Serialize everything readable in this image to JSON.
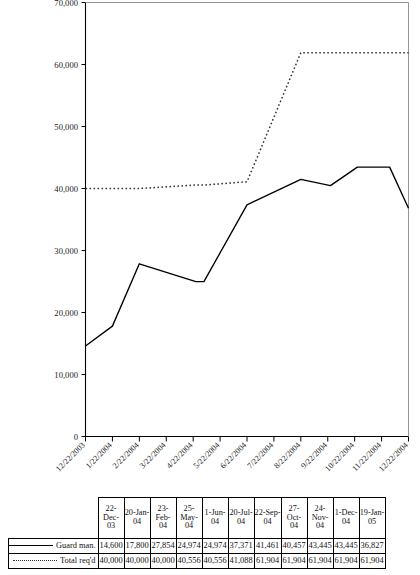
{
  "chart_data": {
    "type": "line",
    "title": "",
    "xlabel": "",
    "ylabel": "",
    "ylim": [
      0,
      70000
    ],
    "ytick_values": [
      0,
      10000,
      20000,
      30000,
      40000,
      50000,
      60000,
      70000
    ],
    "ytick_labels": [
      "0",
      "10,000",
      "20,000",
      "30,000",
      "40,000",
      "50,000",
      "60,000",
      "70,000"
    ],
    "grid": false,
    "legend_position": "table-below",
    "x": [
      "12/22/2003",
      "1/22/2004",
      "2/22/2004",
      "3/22/2004",
      "4/22/2004",
      "5/22/2004",
      "6/22/2004",
      "7/22/2004",
      "8/22/2004",
      "9/22/2004",
      "10/22/2004",
      "11/22/2004",
      "12/22/2004"
    ],
    "categories": [
      "22-Dec-03",
      "20-Jan-04",
      "23-Feb-04",
      "25-May-04",
      "1-Jun-04",
      "20-Jul-04",
      "22-Sep-04",
      "27-Oct-04",
      "24-Nov-04",
      "1-Dec-04",
      "19-Jan-05"
    ],
    "series": [
      {
        "name": "Guard man.",
        "style": "solid",
        "color": "#000000",
        "values": [
          14600,
          17800,
          27854,
          24974,
          24974,
          37371,
          41461,
          40457,
          43445,
          43445,
          36827
        ]
      },
      {
        "name": "Total req'd",
        "style": "dotted",
        "color": "#333333",
        "values": [
          40000,
          40000,
          40000,
          40556,
          40556,
          41088,
          61904,
          61904,
          61904,
          61904,
          61904
        ]
      }
    ]
  },
  "table": {
    "header_dates": [
      "22-Dec-\n03",
      "20-Jan-\n04",
      "23-Feb-\n04",
      "25-\nMay-\n04",
      "1-Jun-\n04",
      "20-Jul-\n04",
      "22-Sep-\n04",
      "27-Oct-\n04",
      "24-\nNov-\n04",
      "1-Dec-\n04",
      "19-Jan-\n05"
    ],
    "rows": [
      {
        "label": "Guard man.",
        "swatch": "solid",
        "values": [
          "14,600",
          "17,800",
          "27,854",
          "24,974",
          "24,974",
          "37,371",
          "41,461",
          "40,457",
          "43,445",
          "43,445",
          "36,827"
        ]
      },
      {
        "label": "Total req'd",
        "swatch": "dotted",
        "values": [
          "40,000",
          "40,000",
          "40,000",
          "40,556",
          "40,556",
          "41,088",
          "61,904",
          "61,904",
          "61,904",
          "61,904",
          "61,904"
        ]
      }
    ]
  }
}
